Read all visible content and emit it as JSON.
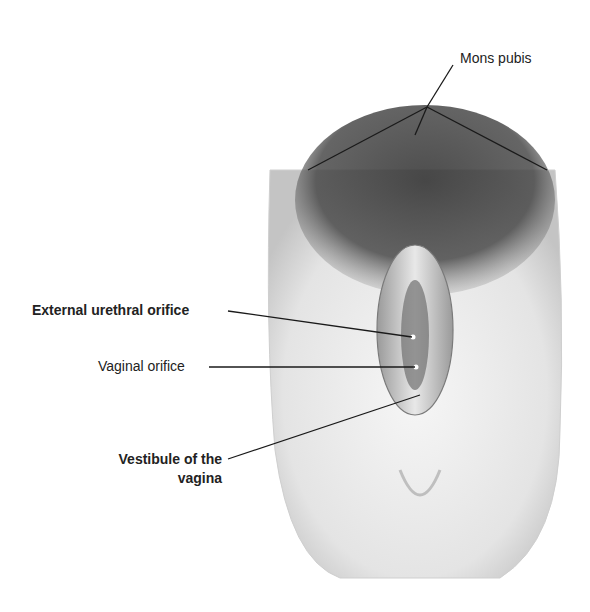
{
  "diagram": {
    "type": "anatomical-illustration",
    "style": "grayscale pencil illustration"
  },
  "labels": {
    "mons_pubis": "Mons pubis",
    "external_urethral_orifice": "External urethral orifice",
    "vaginal_orifice": "Vaginal orifice",
    "vestibule_line1": "Vestibule of the",
    "vestibule_line2": "vagina"
  },
  "colors": {
    "background": "#ffffff",
    "text": "#222222",
    "leader_line": "#1a1a1a",
    "skin_light": "#f2f2f2",
    "skin_shadow": "#bdbdbd",
    "hair": "#3a3a3a"
  }
}
